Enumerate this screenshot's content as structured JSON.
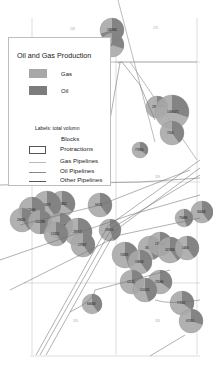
{
  "legend": {
    "title": "Oil and Gas Production",
    "items": [
      {
        "label": "Gas",
        "color": "#a8a8a8"
      },
      {
        "label": "Oil",
        "color": "#7d7d7d"
      }
    ],
    "note": "Labels: total volumn",
    "blocks_label": "Blocks",
    "protractions_label": "Protractions",
    "lines": [
      {
        "label": "Gas Pipelines",
        "color": "#b9b9b9"
      },
      {
        "label": "Oil Pipelines",
        "color": "#8a8a8a"
      },
      {
        "label": "Other Pipelines",
        "color": "#555555"
      }
    ]
  },
  "colors": {
    "gas": "#a8a8a8",
    "oil": "#7d7d7d",
    "block_line": "#c8c8c8",
    "protraction_line": "#9a9a9a",
    "pipeline": "#777777"
  },
  "map": {
    "block_labels": [
      "263",
      "270",
      "313",
      "319",
      "321",
      "355",
      "326"
    ],
    "production_sites": [
      {
        "label": "186961",
        "oil_share": 0.7
      },
      {
        "label": "976",
        "oil_share": 0.3
      },
      {
        "label": "285229",
        "oil_share": 0.25
      },
      {
        "label": "1066471",
        "oil_share": 0.3
      },
      {
        "label": "7052",
        "oil_share": 0.4
      },
      {
        "label": "77834",
        "oil_share": 0.35
      },
      {
        "label": "30058",
        "oil_share": 0.4
      },
      {
        "label": "79486",
        "oil_share": 0.45
      },
      {
        "label": "111862",
        "oil_share": 0.35
      },
      {
        "label": "15473",
        "oil_share": 0.4
      },
      {
        "label": "12066",
        "oil_share": 0.45
      },
      {
        "label": "29625",
        "oil_share": 0.4
      },
      {
        "label": "150289",
        "oil_share": 0.5
      },
      {
        "label": "105418",
        "oil_share": 0.4
      },
      {
        "label": "28917",
        "oil_share": 0.35
      },
      {
        "label": "9413",
        "oil_share": 0.4
      },
      {
        "label": "49920",
        "oil_share": 0.45
      },
      {
        "label": "17367",
        "oil_share": 0.4
      },
      {
        "label": "17451",
        "oil_share": 0.4
      },
      {
        "label": "38806",
        "oil_share": 0.45
      },
      {
        "label": "130426",
        "oil_share": 0.5
      },
      {
        "label": "70381",
        "oil_share": 0.45
      },
      {
        "label": "18843",
        "oil_share": 0.4
      },
      {
        "label": "41111",
        "oil_share": 0.4
      },
      {
        "label": "117456",
        "oil_share": 0.4
      },
      {
        "label": "5460",
        "oil_share": 0.4
      },
      {
        "label": "23566",
        "oil_share": 0.35
      },
      {
        "label": "101011",
        "oil_share": 0.45
      },
      {
        "label": "66608",
        "oil_share": 0.4
      },
      {
        "label": "97861",
        "oil_share": 0.35
      },
      {
        "label": "67411",
        "oil_share": 0.3
      }
    ]
  }
}
